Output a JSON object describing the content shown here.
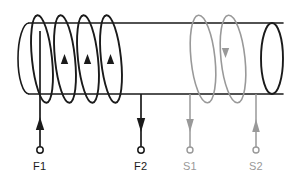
{
  "diagram": {
    "type": "schematic",
    "background_color": "#ffffff",
    "colors": {
      "field_coil": "#1a1a1a",
      "sense_coil": "#999999",
      "cylinder": "#1a1a1a"
    },
    "cylinder": {
      "name": "core-cylinder",
      "left_x": 18,
      "right_x": 283,
      "top_y": 23,
      "bottom_y": 94,
      "ellipse_rx": 11,
      "ellipse_ry": 35.5
    },
    "field_coil": {
      "name": "field-coil",
      "turns": 4,
      "color": "#1a1a1a",
      "loop_centers_x": [
        42,
        65,
        88,
        111
      ],
      "current_direction": "up",
      "label": "F"
    },
    "sense_coil": {
      "name": "sense-coil",
      "turns": 2,
      "color": "#999999",
      "loop_centers_x": [
        203,
        233
      ],
      "current_direction": "down",
      "label": "S"
    },
    "terminals": [
      {
        "id": "F1",
        "label": "F1",
        "x": 40,
        "lead_top_y": 60,
        "node_y": 150,
        "label_y": 168,
        "color": "#1a1a1a",
        "arrow_direction": "up",
        "group": "field"
      },
      {
        "id": "F2",
        "label": "F2",
        "x": 141,
        "lead_top_y": 94,
        "node_y": 150,
        "label_y": 168,
        "color": "#1a1a1a",
        "arrow_direction": "down",
        "group": "field"
      },
      {
        "id": "S1",
        "label": "S1",
        "x": 190,
        "lead_top_y": 94,
        "node_y": 150,
        "label_y": 168,
        "color": "#999999",
        "arrow_direction": "down",
        "group": "sense"
      },
      {
        "id": "S2",
        "label": "S2",
        "x": 256,
        "lead_top_y": 94,
        "node_y": 150,
        "label_y": 168,
        "color": "#999999",
        "arrow_direction": "up",
        "group": "sense"
      }
    ]
  }
}
